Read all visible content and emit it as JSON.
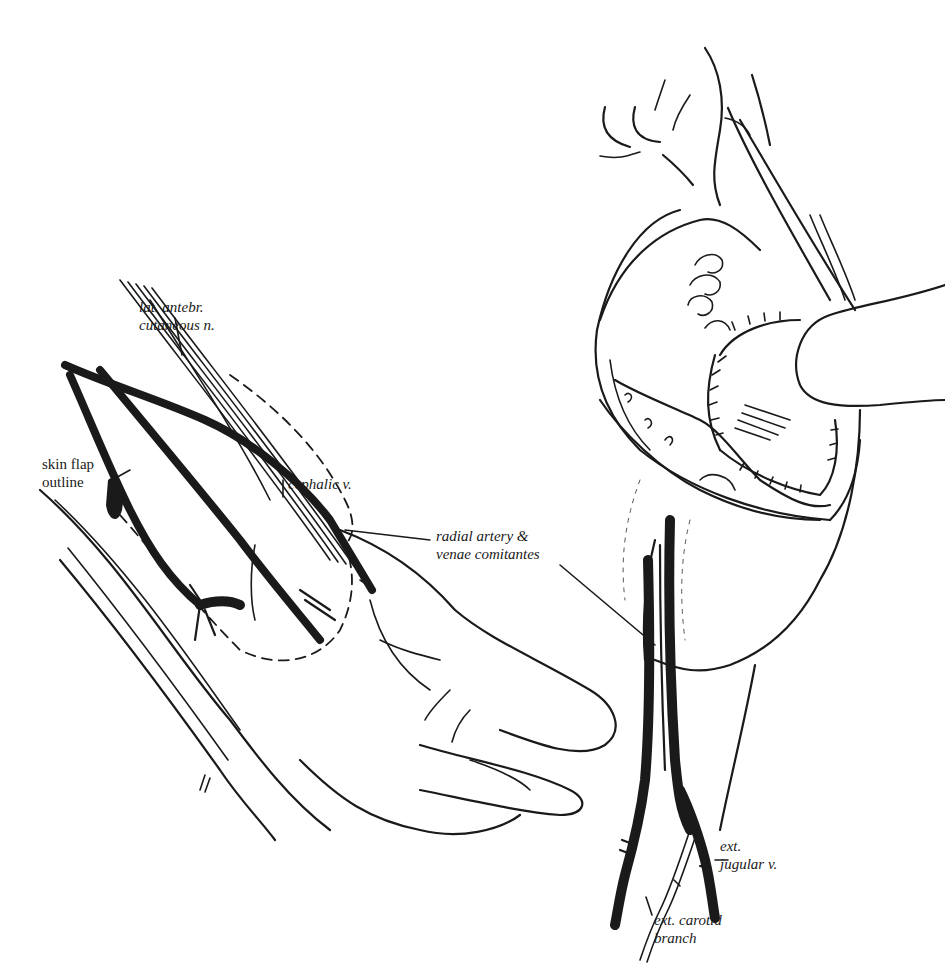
{
  "figure": {
    "panels": [
      {
        "id": "forearm",
        "labels": [
          {
            "key": "lat_antebr",
            "text": "lat. antebr.\ncutaneous n."
          },
          {
            "key": "skin_flap",
            "text": "skin flap\noutline"
          },
          {
            "key": "cephalic",
            "text": "cephalic v."
          },
          {
            "key": "radial",
            "text": "radial artery &\nvenae comitantes"
          }
        ]
      },
      {
        "id": "oral-neck",
        "labels": [
          {
            "key": "ext_jugular",
            "text": "ext.\njugular v."
          },
          {
            "key": "ext_carotid",
            "text": "ext. carotid\nbranch"
          }
        ]
      }
    ]
  },
  "labels": {
    "lat_antebr": "lat. antebr.\ncutaneous n.",
    "skin_flap": "skin flap\noutline",
    "cephalic": "cephalic v.",
    "radial": "radial artery &\nvenae comitantes",
    "ext_jugular": "ext.\njugular v.",
    "ext_carotid": "ext. carotid\nbranch"
  },
  "colors": {
    "ink": "#1a1a1a",
    "background": "#ffffff"
  }
}
